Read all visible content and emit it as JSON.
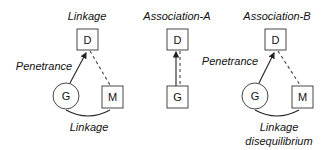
{
  "panels": [
    {
      "title": "Linkage",
      "nodes": {
        "disease": "D",
        "gene": "G",
        "marker": "M"
      },
      "edges": {
        "gene_to_disease": "Penetrance",
        "gene_to_marker": "Linkage",
        "disease_to_marker": ""
      }
    },
    {
      "title": "Association-A",
      "nodes": {
        "disease": "D",
        "gene": "G"
      },
      "edges": {
        "gene_to_disease": ""
      }
    },
    {
      "title": "Association-B",
      "nodes": {
        "disease": "D",
        "gene": "G",
        "marker": "M"
      },
      "edges": {
        "gene_to_disease": "Penetrance",
        "gene_to_marker_line1": "Linkage",
        "gene_to_marker_line2": "disequilibrium",
        "disease_to_marker": ""
      }
    }
  ]
}
